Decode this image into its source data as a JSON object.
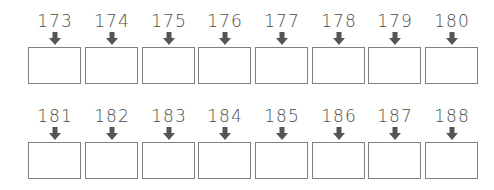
{
  "worksheet": {
    "rows": [
      {
        "numbers": [
          "173",
          "174",
          "175",
          "176",
          "177",
          "178",
          "179",
          "180"
        ]
      },
      {
        "numbers": [
          "181",
          "182",
          "183",
          "184",
          "185",
          "186",
          "187",
          "188"
        ]
      }
    ],
    "answer_boxes": [
      "",
      "",
      "",
      "",
      "",
      "",
      "",
      "",
      "",
      "",
      "",
      "",
      "",
      "",
      "",
      ""
    ]
  },
  "colors": {
    "number": "#4a4a4a",
    "arrow": "#555555",
    "box_border": "#808080"
  }
}
